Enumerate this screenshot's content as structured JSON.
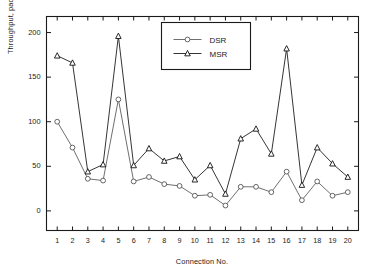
{
  "chart_data": {
    "type": "line",
    "title": "",
    "xlabel": "Connection No.",
    "ylabel": "Throughput, packets/second",
    "categories": [
      1,
      2,
      3,
      4,
      5,
      6,
      7,
      8,
      9,
      10,
      11,
      12,
      13,
      14,
      15,
      16,
      17,
      18,
      19,
      20
    ],
    "x": [
      1,
      2,
      3,
      4,
      5,
      6,
      7,
      8,
      9,
      10,
      11,
      12,
      13,
      14,
      15,
      16,
      17,
      18,
      19,
      20
    ],
    "series": [
      {
        "name": "DSR",
        "marker": "circle",
        "color": "#555555",
        "values": [
          100,
          71,
          36,
          34,
          125,
          33,
          38,
          30,
          28,
          17,
          18,
          6,
          27,
          27,
          21,
          44,
          12,
          33,
          17,
          21
        ]
      },
      {
        "name": "MSR",
        "marker": "triangle",
        "color": "#111111",
        "values": [
          174,
          166,
          44,
          52,
          196,
          51,
          70,
          56,
          61,
          35,
          51,
          19,
          81,
          92,
          64,
          182,
          29,
          71,
          53,
          38
        ]
      }
    ],
    "xlim": [
      0.3,
      20.7
    ],
    "ylim": [
      -22,
      218
    ],
    "yticks": [
      0,
      50,
      100,
      150,
      200
    ],
    "ytick_labels": [
      "0",
      "50",
      "100",
      "150",
      "200"
    ],
    "xticks": [
      1,
      2,
      3,
      4,
      5,
      6,
      7,
      8,
      9,
      10,
      11,
      12,
      13,
      14,
      15,
      16,
      17,
      18,
      19,
      20
    ],
    "xtick_labels": [
      "1",
      "2",
      "3",
      "4",
      "5",
      "6",
      "7",
      "8",
      "9",
      "10",
      "11",
      "12",
      "13",
      "14",
      "15",
      "16",
      "17",
      "18",
      "19",
      "20"
    ],
    "grid": false,
    "legend_position": "top-center",
    "legend_entries": [
      "DSR",
      "MSR"
    ],
    "box": true
  },
  "figure": {
    "background": "#ffffff",
    "axis_color": "#1a1a1a"
  }
}
